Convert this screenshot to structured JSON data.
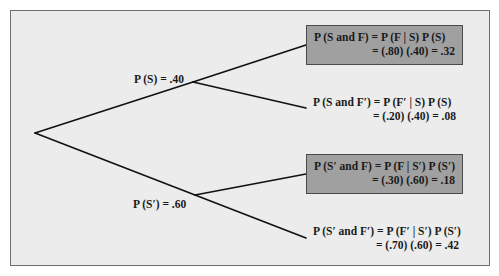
{
  "diagram": {
    "type": "probability-tree",
    "colors": {
      "background": "#ececec",
      "frame_border": "#6e6e6e",
      "shaded_box": "#a0a0a0",
      "shaded_border": "#4a4a4a",
      "line": "#111111",
      "text": "#1a1a1a"
    },
    "first_stage": [
      {
        "id": "S",
        "label": "P (S) = .40"
      },
      {
        "id": "S_prime",
        "label": "P (S′) = .60"
      }
    ],
    "outcomes": [
      {
        "id": "S_and_F",
        "shaded": true,
        "line1": "P (S and F) = P (F | S) P (S)",
        "line2": "= (.80) (.40) = .32"
      },
      {
        "id": "S_and_F_prime",
        "shaded": false,
        "line1": "P (S and F′) = P (F′ | S) P (S)",
        "line2": "= (.20) (.40) = .08"
      },
      {
        "id": "S_prime_and_F",
        "shaded": true,
        "line1": "P (S′ and F) = P (F | S′) P (S′)",
        "line2": "= (.30) (.60) = .18"
      },
      {
        "id": "S_prime_and_F_prime",
        "shaded": false,
        "line1": "P (S′ and F′) = P (F′ | S′) P (S′)",
        "line2": "= (.70) (.60) = .42"
      }
    ]
  }
}
